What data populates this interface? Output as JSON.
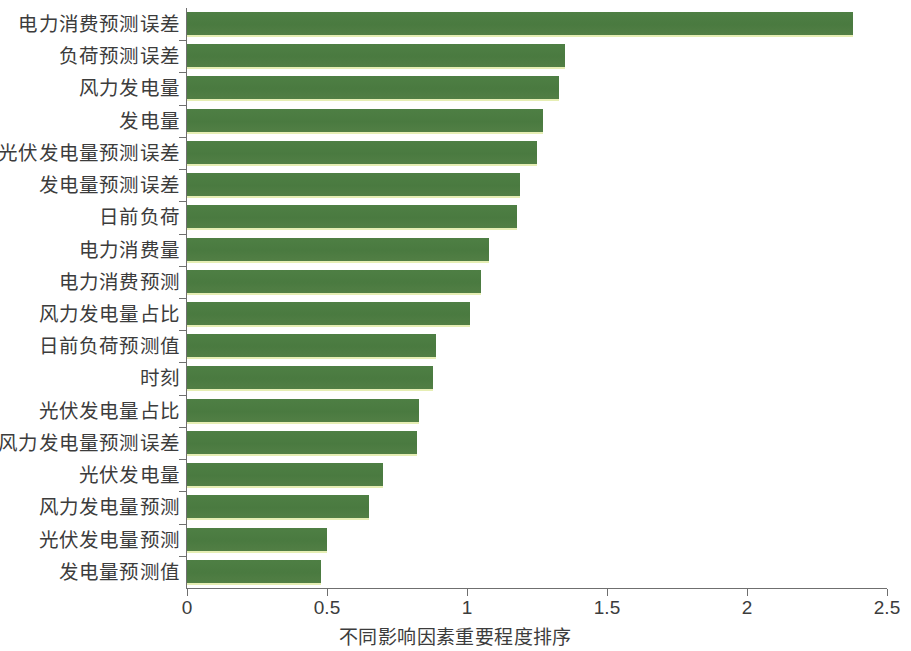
{
  "chart_data": {
    "type": "bar",
    "orientation": "horizontal",
    "title": "",
    "subtitle": "",
    "xlabel": "不同影响因素重要程度排序",
    "ylabel": "",
    "xlim": [
      0,
      2.5
    ],
    "xticks": [
      "0",
      "0.5",
      "1",
      "1.5",
      "2",
      "2.5"
    ],
    "xtick_values": [
      0,
      0.5,
      1,
      1.5,
      2,
      2.5
    ],
    "grid": false,
    "legend": null,
    "bar_color": "#4a7a40",
    "bar_edge_color": "#e6eeb4",
    "axis_color": "#6f6f6f",
    "background": "#ffffff",
    "categories": [
      "电力消费预测误差",
      "负荷预测误差",
      "风力发电量",
      "发电量",
      "光伏发电量预测误差",
      "发电量预测误差",
      "日前负荷",
      "电力消费量",
      "电力消费预测",
      "风力发电量占比",
      "日前负荷预测值",
      "时刻",
      "光伏发电量占比",
      "风力发电量预测误差",
      "光伏发电量",
      "风力发电量预测",
      "光伏发电量预测",
      "发电量预测值"
    ],
    "values": [
      2.38,
      1.35,
      1.33,
      1.27,
      1.25,
      1.19,
      1.18,
      1.08,
      1.05,
      1.01,
      0.89,
      0.88,
      0.83,
      0.82,
      0.7,
      0.65,
      0.5,
      0.48
    ]
  }
}
